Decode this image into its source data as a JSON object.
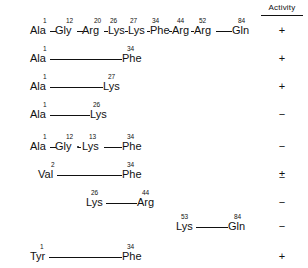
{
  "header": {
    "activity_label": "Activity"
  },
  "chart_data": {
    "type": "table",
    "title": "",
    "columns": [
      "Fragment",
      "Activity"
    ],
    "rows": [
      {
        "residues": [
          {
            "pos": "1",
            "name": "Ala"
          },
          {
            "pos": "12",
            "name": "Gly"
          },
          {
            "pos": "20",
            "name": "Arg"
          },
          {
            "pos": "26",
            "name": "Lys"
          },
          {
            "pos": "27",
            "name": "Lys"
          },
          {
            "pos": "34",
            "name": "Phe"
          },
          {
            "pos": "44",
            "name": "Arg"
          },
          {
            "pos": "52",
            "name": "Arg"
          },
          {
            "pos": "84",
            "name": "Gln"
          }
        ],
        "activity": "+"
      },
      {
        "residues": [
          {
            "pos": "1",
            "name": "Ala"
          },
          {
            "pos": "34",
            "name": "Phe"
          }
        ],
        "activity": "+"
      },
      {
        "residues": [
          {
            "pos": "1",
            "name": "Ala"
          },
          {
            "pos": "27",
            "name": "Lys"
          }
        ],
        "activity": "+"
      },
      {
        "residues": [
          {
            "pos": "1",
            "name": "Ala"
          },
          {
            "pos": "26",
            "name": "Lys"
          }
        ],
        "activity": "−"
      },
      {
        "residues": [
          {
            "pos": "1",
            "name": "Ala"
          },
          {
            "pos": "12",
            "name": "Gly"
          },
          {
            "pos": "13",
            "name": "Lys"
          },
          {
            "pos": "34",
            "name": "Phe"
          }
        ],
        "activity": "−"
      },
      {
        "residues": [
          {
            "pos": "2",
            "name": "Val"
          },
          {
            "pos": "34",
            "name": "Phe"
          }
        ],
        "activity": "±"
      },
      {
        "residues": [
          {
            "pos": "26",
            "name": "Lys"
          },
          {
            "pos": "44",
            "name": "Arg"
          }
        ],
        "activity": "−"
      },
      {
        "residues": [
          {
            "pos": "53",
            "name": "Lys"
          },
          {
            "pos": "84",
            "name": "Gln"
          }
        ],
        "activity": "−"
      },
      {
        "residues": [
          {
            "pos": "1",
            "name": "Tyr"
          },
          {
            "pos": "34",
            "name": "Phe"
          }
        ],
        "activity": "+"
      }
    ]
  },
  "rows": [
    {
      "top": 12,
      "activity": "+",
      "residues": [
        {
          "pos": "1",
          "name": "Ala",
          "x": 30,
          "px": 43
        },
        {
          "pos": "12",
          "name": "Gly",
          "x": 55,
          "px": 66
        },
        {
          "pos": "20",
          "name": "Arg",
          "x": 82,
          "px": 94
        },
        {
          "pos": "26",
          "name": "Lys",
          "x": 108,
          "px": 110
        },
        {
          "pos": "27",
          "name": "Lys",
          "x": 128,
          "px": 130
        },
        {
          "pos": "34",
          "name": "Phe",
          "x": 150,
          "px": 152
        },
        {
          "pos": "44",
          "name": "Arg",
          "x": 172,
          "px": 177
        },
        {
          "pos": "52",
          "name": "Arg",
          "x": 194,
          "px": 199
        },
        {
          "pos": "84",
          "name": "Gln",
          "x": 232,
          "px": 238
        }
      ],
      "links": [
        {
          "x": 50,
          "w": 6
        },
        {
          "x": 77,
          "w": 6
        },
        {
          "x": 104,
          "w": 4
        },
        {
          "x": 125,
          "w": 3
        },
        {
          "x": 147,
          "w": 3
        },
        {
          "x": 169,
          "w": 3
        },
        {
          "x": 191,
          "w": 3
        },
        {
          "x": 216,
          "w": 16
        }
      ],
      "joints": []
    },
    {
      "top": 40,
      "activity": "+",
      "residues": [
        {
          "pos": "1",
          "name": "Ala",
          "x": 30,
          "px": 43
        },
        {
          "pos": "34",
          "name": "Phe",
          "x": 122,
          "px": 127
        }
      ],
      "links": [
        {
          "x": 50,
          "w": 72
        }
      ],
      "joints": []
    },
    {
      "top": 68,
      "activity": "+",
      "residues": [
        {
          "pos": "1",
          "name": "Ala",
          "x": 30,
          "px": 43
        },
        {
          "pos": "27",
          "name": "Lys",
          "x": 103,
          "px": 108
        }
      ],
      "links": [
        {
          "x": 50,
          "w": 53
        }
      ],
      "joints": []
    },
    {
      "top": 96,
      "activity": "−",
      "residues": [
        {
          "pos": "1",
          "name": "Ala",
          "x": 30,
          "px": 43
        },
        {
          "pos": "26",
          "name": "Lys",
          "x": 90,
          "px": 93
        }
      ],
      "links": [
        {
          "x": 50,
          "w": 40
        }
      ],
      "joints": []
    },
    {
      "top": 128,
      "activity": "−",
      "residues": [
        {
          "pos": "1",
          "name": "Ala",
          "x": 30,
          "px": 43
        },
        {
          "pos": "12",
          "name": "Gly",
          "x": 55,
          "px": 66
        },
        {
          "pos": "13",
          "name": "Lys",
          "x": 82,
          "px": 89
        },
        {
          "pos": "34",
          "name": "Phe",
          "x": 122,
          "px": 127
        }
      ],
      "links": [
        {
          "x": 50,
          "w": 6
        },
        {
          "x": 78,
          "w": 3
        },
        {
          "x": 104,
          "w": 18
        }
      ],
      "joints": [
        {
          "x": 77
        }
      ]
    },
    {
      "top": 156,
      "activity": "±",
      "residues": [
        {
          "pos": "2",
          "name": "Val",
          "x": 38,
          "px": 51
        },
        {
          "pos": "34",
          "name": "Phe",
          "x": 122,
          "px": 127
        }
      ],
      "links": [
        {
          "x": 57,
          "w": 65
        }
      ],
      "joints": []
    },
    {
      "top": 184,
      "activity": "−",
      "residues": [
        {
          "pos": "26",
          "name": "Lys",
          "x": 86,
          "px": 91
        },
        {
          "pos": "44",
          "name": "Arg",
          "x": 137,
          "px": 142
        }
      ],
      "links": [
        {
          "x": 106,
          "w": 31
        }
      ],
      "joints": []
    },
    {
      "top": 208,
      "activity": "−",
      "residues": [
        {
          "pos": "53",
          "name": "Lys",
          "x": 176,
          "px": 181
        },
        {
          "pos": "84",
          "name": "Gln",
          "x": 228,
          "px": 234
        }
      ],
      "links": [
        {
          "x": 196,
          "w": 32
        }
      ],
      "joints": []
    },
    {
      "top": 238,
      "activity": "+",
      "residues": [
        {
          "pos": "1",
          "name": "Tyr",
          "x": 30,
          "px": 40
        },
        {
          "pos": "34",
          "name": "Phe",
          "x": 122,
          "px": 127
        }
      ],
      "links": [
        {
          "x": 49,
          "w": 73
        }
      ],
      "joints": []
    }
  ]
}
